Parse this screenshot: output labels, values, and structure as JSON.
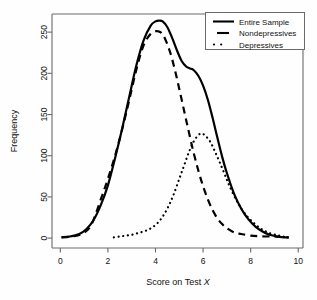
{
  "figure": {
    "background": "#fefefe",
    "frame_color": "#555555",
    "line_color": "#000000"
  },
  "chart_data": {
    "type": "line",
    "title": "",
    "xlabel": "Score on Test X",
    "xlabel_plain": "Score on Test ",
    "xlabel_italic": "X",
    "ylabel": "Frequency",
    "xlim": [
      -0.35,
      10.2
    ],
    "ylim": [
      -12,
      272
    ],
    "xticks": [
      0,
      2,
      4,
      6,
      8,
      10
    ],
    "xtick_labels": [
      "0",
      "2",
      "4",
      "6",
      "8",
      "10"
    ],
    "yticks": [
      0,
      50,
      100,
      150,
      200,
      250
    ],
    "ytick_labels": [
      "0",
      "50",
      "100",
      "150",
      "200",
      "250"
    ],
    "grid": false,
    "legend_position": "top-right",
    "series": [
      {
        "name": "Entire Sample",
        "style": "solid",
        "linewidth": 2.2,
        "x": [
          0.05,
          0.4,
          0.8,
          1.1,
          1.4,
          1.7,
          2.0,
          2.3,
          2.6,
          2.9,
          3.2,
          3.5,
          3.8,
          4.0,
          4.15,
          4.3,
          4.5,
          4.7,
          4.9,
          5.1,
          5.3,
          5.45,
          5.6,
          5.8,
          6.0,
          6.2,
          6.4,
          6.6,
          6.8,
          7.0,
          7.3,
          7.6,
          7.9,
          8.2,
          8.5,
          8.8,
          9.1,
          9.4,
          9.6
        ],
        "y": [
          1,
          2,
          5,
          11,
          22,
          40,
          64,
          97,
          133,
          172,
          210,
          240,
          258,
          263,
          264,
          263,
          256,
          243,
          228,
          215,
          208,
          206,
          204,
          197,
          185,
          168,
          146,
          122,
          99,
          79,
          54,
          36,
          23,
          14,
          8,
          4,
          2,
          1,
          1
        ]
      },
      {
        "name": "Nondepressives",
        "style": "dashed",
        "linewidth": 2.2,
        "x": [
          0.05,
          0.5,
          0.9,
          1.3,
          1.7,
          2.0,
          2.3,
          2.6,
          2.9,
          3.2,
          3.5,
          3.8,
          4.0,
          4.1,
          4.25,
          4.4,
          4.6,
          4.8,
          5.0,
          5.2,
          5.4,
          5.6,
          5.8,
          6.0,
          6.2,
          6.4,
          6.6,
          6.8,
          7.0,
          7.3,
          7.6,
          8.0,
          8.5,
          9.0,
          9.4,
          9.6
        ],
        "y": [
          1,
          2,
          5,
          16,
          47,
          72,
          100,
          132,
          168,
          205,
          234,
          248,
          251,
          251,
          249,
          242,
          227,
          206,
          181,
          155,
          129,
          104,
          82,
          63,
          47,
          34,
          24,
          17,
          12,
          7,
          5,
          3,
          2,
          2,
          1,
          1
        ]
      },
      {
        "name": "Depressives",
        "style": "dotted",
        "linewidth": 2.2,
        "x": [
          2.25,
          2.5,
          2.75,
          3.0,
          3.25,
          3.5,
          3.75,
          4.0,
          4.25,
          4.5,
          4.75,
          5.0,
          5.2,
          5.4,
          5.6,
          5.8,
          5.95,
          6.1,
          6.3,
          6.5,
          6.7,
          6.9,
          7.1,
          7.4,
          7.7,
          8.0,
          8.4,
          8.8,
          9.2,
          9.5
        ],
        "y": [
          1,
          2,
          3,
          4,
          6,
          8,
          11,
          16,
          24,
          36,
          52,
          72,
          88,
          104,
          117,
          125,
          127,
          124,
          117,
          105,
          92,
          78,
          64,
          46,
          32,
          22,
          12,
          6,
          3,
          1
        ]
      }
    ]
  },
  "legend": {
    "entries": [
      {
        "label": "Entire Sample",
        "style": "solid"
      },
      {
        "label": "Nondepressives",
        "style": "dashed"
      },
      {
        "label": "Depressives",
        "style": "dotted"
      }
    ]
  }
}
